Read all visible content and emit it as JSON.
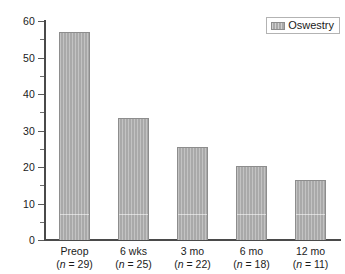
{
  "chart_data": {
    "type": "bar",
    "title": "",
    "xlabel": "",
    "ylabel": "",
    "ylim": [
      0,
      60
    ],
    "grid": false,
    "legend_position": "top-right",
    "categories": [
      "Preop",
      "6 wks",
      "3 mo",
      "6 mo",
      "12 mo"
    ],
    "category_counts": [
      29,
      25,
      22,
      18,
      11
    ],
    "category_count_labels": [
      "(n = 29)",
      "(n = 25)",
      "(n = 22)",
      "(n = 18)",
      "(n = 11)"
    ],
    "series": [
      {
        "name": "Oswestry",
        "values": [
          57.0,
          33.5,
          25.5,
          20.3,
          16.5
        ],
        "color": "#a9a9a9"
      }
    ],
    "y_major_ticks": [
      0,
      10,
      20,
      30,
      40,
      50,
      60
    ],
    "y_major_tick_labels": [
      "0",
      "10",
      "20",
      "30",
      "40",
      "50",
      "60"
    ],
    "y_minor_ticks": [
      5,
      15,
      25,
      35,
      45,
      55
    ]
  },
  "legend": {
    "entries": [
      {
        "label": "Oswestry",
        "swatch_name": "oswestry-swatch"
      }
    ]
  },
  "colors": {
    "bar_fill": "#a9a9a9",
    "bar_stroke": "#8d8d8d",
    "axis": "#4a4a4a",
    "text": "#1a1a1a",
    "background": "#ffffff"
  }
}
